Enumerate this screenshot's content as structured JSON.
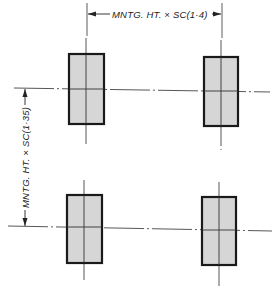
{
  "drawing": {
    "type": "column layout / pier spacing plan",
    "horizontal_dimension_label": "MNTG. HT. × SC(1·4)",
    "vertical_dimension_label": "MNTG. HT. × SC(1·35)",
    "colors": {
      "line": "#222222",
      "fill": "#d6d6d6",
      "background": "#ffffff"
    },
    "elements": [
      {
        "name": "column-top-left",
        "row": 1,
        "col": 1
      },
      {
        "name": "column-top-right",
        "row": 1,
        "col": 2
      },
      {
        "name": "column-bottom-left",
        "row": 2,
        "col": 1
      },
      {
        "name": "column-bottom-right",
        "row": 2,
        "col": 2
      }
    ]
  }
}
